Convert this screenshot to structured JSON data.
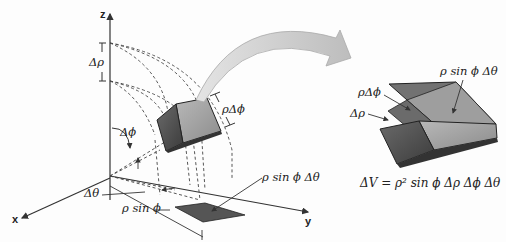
{
  "axes": {
    "x": "x",
    "y": "y",
    "z": "z"
  },
  "left_labels": {
    "delta_rho": "Δρ",
    "rho_delta_phi": "ρΔϕ",
    "delta_phi": "Δϕ",
    "delta_theta": "Δθ",
    "rho_sin_phi": "ρ sin ϕ",
    "rho_sin_phi_delta_theta": "ρ sin ϕ Δθ"
  },
  "right_labels": {
    "rho_sin_phi_delta_theta": "ρ sin ϕ Δθ",
    "rho_delta_phi": "ρΔϕ",
    "delta_rho": "Δρ"
  },
  "formula": "ΔV = ρ² sin ϕ Δρ Δϕ Δθ",
  "colors": {
    "box_dark": "#5a5a5a",
    "box_light": "#a8a8a8",
    "box_top": "#7a7a7a",
    "arrow_fill": "#c8c8c8",
    "line": "#333333"
  }
}
